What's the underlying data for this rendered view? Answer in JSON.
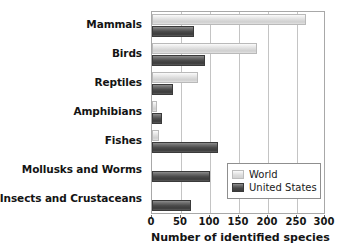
{
  "chart_data": {
    "type": "bar",
    "orientation": "horizontal",
    "title": "",
    "xlabel": "Number of identified species",
    "ylabel": "",
    "xlim": [
      0,
      300
    ],
    "xticks": [
      0,
      50,
      100,
      150,
      200,
      250,
      300
    ],
    "xtick_labels": [
      "0",
      "50",
      "100",
      "150",
      "200",
      "250",
      "300"
    ],
    "grid": true,
    "grid_axis": "x",
    "legend_position": "lower right",
    "categories": [
      "Mammals",
      "Birds",
      "Reptiles",
      "Amphibians",
      "Fishes",
      "Mollusks and Worms",
      "Insects and Crustaceans"
    ],
    "series": [
      {
        "name": "World",
        "color": "#dcdcdc",
        "values": [
          269,
          183,
          80,
          9,
          12,
          0,
          0
        ]
      },
      {
        "name": "United States",
        "color": "#474747",
        "values": [
          74,
          93,
          37,
          18,
          115,
          102,
          68
        ]
      }
    ]
  },
  "legend": {
    "items": [
      {
        "label": "World",
        "swatch": "world-swatch"
      },
      {
        "label": "United States",
        "swatch": "united-states-swatch"
      }
    ]
  },
  "colors": {
    "world_bar": "#dcdcdc",
    "us_bar": "#474747",
    "gridline": "#c4c4c4",
    "axis_border": "#a8a8a8",
    "text": "#141414",
    "background": "#ffffff"
  }
}
